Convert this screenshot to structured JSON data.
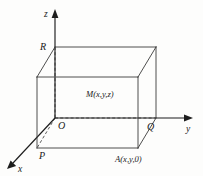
{
  "figure": {
    "background_color": "#fdfdfc",
    "line_color": "#3b3b3b",
    "axis_color": "#1d1d1d",
    "label_color": "#1a1a1a"
  },
  "axes": [
    {
      "id": "z",
      "label": "z",
      "label_x": 44,
      "label_y": 17,
      "from_x": 55,
      "from_y": 118,
      "to_x": 55,
      "to_y": 16,
      "head": "55,9 51.6,18 58.4,18"
    },
    {
      "id": "y",
      "label": "y",
      "label_x": 186,
      "label_y": 132,
      "from_x": 55,
      "from_y": 118,
      "to_x": 185,
      "to_y": 118,
      "head": "193,118 184,114.6 184,121.4"
    },
    {
      "id": "x",
      "label": "x",
      "label_x": 18,
      "label_y": 172,
      "from_x": 55,
      "from_y": 118,
      "to_x": 13,
      "to_y": 163,
      "head": "7,169 16.1,165.9 10.6,160.4"
    }
  ],
  "vertices": [
    {
      "id": "R",
      "label": "R",
      "x": 55,
      "y": 47,
      "label_x": 40,
      "label_y": 50
    },
    {
      "id": "O",
      "label": "O",
      "x": 55,
      "y": 118,
      "label_x": 58,
      "label_y": 129
    },
    {
      "id": "Q",
      "label": "Q",
      "x": 156,
      "y": 118,
      "label_x": 147,
      "label_y": 130
    },
    {
      "id": "P",
      "label": "P",
      "x": 37,
      "y": 148,
      "label_x": 39,
      "label_y": 159
    }
  ],
  "point_labels": [
    {
      "id": "M",
      "text": "M(x,y,z)",
      "x": 86,
      "y": 97
    },
    {
      "id": "A",
      "text": "A(x,y,0)",
      "x": 115,
      "y": 162
    }
  ],
  "solid_edges": [
    {
      "name": "top-front-edge",
      "x1": 37,
      "y1": 77,
      "x2": 138,
      "y2": 77
    },
    {
      "name": "top-back-edge",
      "x1": 55,
      "y1": 47,
      "x2": 156,
      "y2": 47
    },
    {
      "name": "top-left-edge",
      "x1": 37,
      "y1": 77,
      "x2": 55,
      "y2": 47
    },
    {
      "name": "top-right-edge",
      "x1": 138,
      "y1": 77,
      "x2": 156,
      "y2": 47
    },
    {
      "name": "front-left-vertical",
      "x1": 37,
      "y1": 77,
      "x2": 37,
      "y2": 148
    },
    {
      "name": "front-right-vertical",
      "x1": 138,
      "y1": 77,
      "x2": 138,
      "y2": 148
    },
    {
      "name": "back-right-vertical",
      "x1": 156,
      "y1": 47,
      "x2": 156,
      "y2": 118
    },
    {
      "name": "bottom-front-edge",
      "x1": 37,
      "y1": 148,
      "x2": 138,
      "y2": 148
    },
    {
      "name": "bottom-right-edge",
      "x1": 138,
      "y1": 148,
      "x2": 156,
      "y2": 118
    }
  ],
  "hidden_edges": [
    {
      "name": "back-left-vertical-dashed",
      "x1": 55,
      "y1": 47,
      "x2": 55,
      "y2": 118
    },
    {
      "name": "bottom-back-edge-dashed",
      "x1": 55,
      "y1": 118,
      "x2": 156,
      "y2": 118
    },
    {
      "name": "origin-to-p-dashed",
      "x1": 55,
      "y1": 118,
      "x2": 37,
      "y2": 148
    }
  ]
}
